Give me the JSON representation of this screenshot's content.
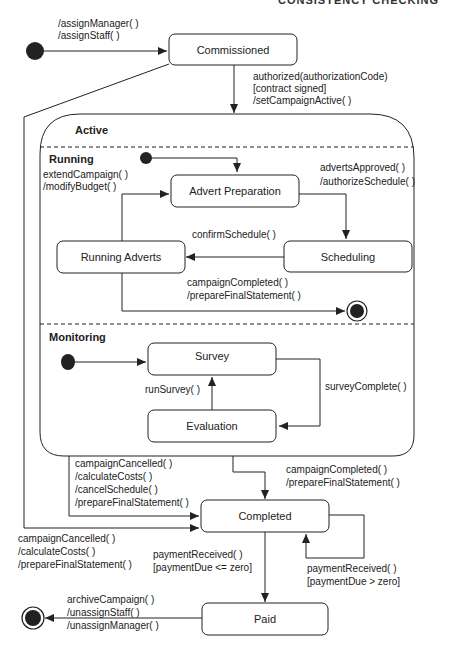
{
  "header": {
    "title_partial": "CONSISTENCY CHECKING"
  },
  "states": {
    "commissioned": "Commissioned",
    "active": "Active",
    "running": "Running",
    "advert_preparation": "Advert Preparation",
    "scheduling": "Scheduling",
    "running_adverts": "Running Adverts",
    "monitoring": "Monitoring",
    "survey": "Survey",
    "evaluation": "Evaluation",
    "completed": "Completed",
    "paid": "Paid"
  },
  "transitions": {
    "initial_to_commissioned": [
      "/assignManager( )",
      "/assignStaff( )"
    ],
    "commissioned_to_active": [
      "authorized(authorizationCode)",
      "[contract signed]",
      "/setCampaignActive( )"
    ],
    "running_internal": [
      "extendCampaign( )",
      "/modifyBudget( )"
    ],
    "prep_to_scheduling": [
      "advertsApproved( )",
      "/authorizeSchedule( )"
    ],
    "scheduling_to_running": [
      "confirmSchedule( )"
    ],
    "running_to_final": [
      "campaignCompleted( )",
      "/prepareFinalStatement( )"
    ],
    "evaluation_to_survey": [
      "runSurvey( )"
    ],
    "survey_to_evaluation": [
      "surveyComplete( )"
    ],
    "active_cancel_to_completed": [
      "campaignCancelled( )",
      "/calculateCosts( )",
      "/cancelSchedule( )",
      "/prepareFinalStatement( )"
    ],
    "active_complete_to_completed": [
      "campaignCompleted( )",
      "/prepareFinalStatement( )"
    ],
    "commissioned_cancel_to_completed": [
      "campaignCancelled( )",
      "/calculateCosts( )",
      "/prepareFinalStatement( )"
    ],
    "completed_to_paid": [
      "paymentReceived( )",
      "[paymentDue <= zero]"
    ],
    "completed_self": [
      "paymentReceived( )",
      "[paymentDue > zero]"
    ],
    "paid_to_final": [
      "archiveCampaign( )",
      "/unassignStaff( )",
      "/unassignManager( )"
    ]
  }
}
